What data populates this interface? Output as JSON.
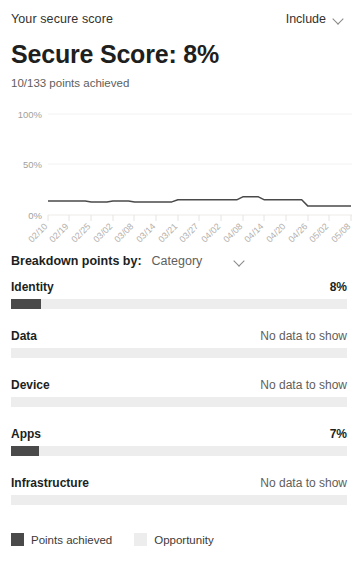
{
  "header": {
    "title": "Your secure score",
    "include_label": "Include",
    "chevron_icon": "chevron-down-icon"
  },
  "score": {
    "title": "Secure Score: 8%",
    "subtitle": "10/133 points achieved",
    "percent": 8,
    "points_achieved": 10,
    "points_total": 133
  },
  "chart_data": {
    "type": "line",
    "title": "",
    "xlabel": "",
    "ylabel": "",
    "ylim": [
      0,
      100
    ],
    "ytick_labels": [
      "0%",
      "50%",
      "100%"
    ],
    "ytick_values": [
      0,
      50,
      100
    ],
    "grid": true,
    "legend_position": "none",
    "categories": [
      "02/10",
      "02/19",
      "02/25",
      "03/02",
      "03/08",
      "03/14",
      "03/21",
      "03/27",
      "04/02",
      "04/08",
      "04/14",
      "04/20",
      "04/26",
      "05/02",
      "05/08"
    ],
    "series": [
      {
        "name": "Secure score",
        "color": "#4a4a4a",
        "values": [
          14,
          14,
          13,
          14,
          13,
          13,
          15,
          15,
          15,
          18,
          15,
          15,
          9,
          9,
          9
        ]
      }
    ]
  },
  "breakdown": {
    "label": "Breakdown points by:",
    "selected": "Category",
    "chevron_icon": "chevron-down-icon",
    "rows": [
      {
        "name": "Identity",
        "value": "8%",
        "has_data": true,
        "fill_percent": 8.9
      },
      {
        "name": "Data",
        "value": "No data to show",
        "has_data": false,
        "fill_percent": 0
      },
      {
        "name": "Device",
        "value": "No data to show",
        "has_data": false,
        "fill_percent": 0
      },
      {
        "name": "Apps",
        "value": "7%",
        "has_data": true,
        "fill_percent": 8.3
      },
      {
        "name": "Infrastructure",
        "value": "No data to show",
        "has_data": false,
        "fill_percent": 0
      }
    ]
  },
  "legend": {
    "items": [
      {
        "label": "Points achieved",
        "color": "#4a4a4a",
        "swatch": "achieved"
      },
      {
        "label": "Opportunity",
        "color": "#ededed",
        "swatch": "opportunity"
      }
    ]
  },
  "colors": {
    "accent_dark": "#4a4a4a",
    "track_light": "#ededed",
    "text_primary": "#201f1e",
    "text_secondary": "#605e5c"
  }
}
